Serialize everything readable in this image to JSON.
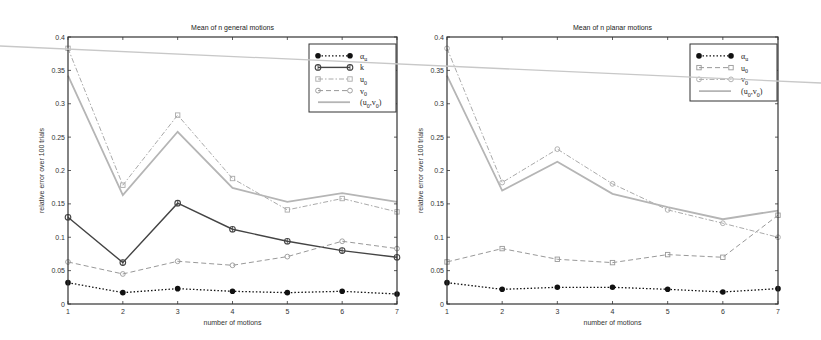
{
  "chart_data": [
    {
      "type": "line",
      "title": "Mean of n general motions",
      "xlabel": "number of motions",
      "ylabel": "relative error  over 100 trials",
      "x": [
        1,
        2,
        3,
        4,
        5,
        6,
        7
      ],
      "xlim": [
        1,
        7
      ],
      "ylim": [
        0,
        0.4
      ],
      "yticks": [
        0,
        0.05,
        0.1,
        0.15,
        0.2,
        0.25,
        0.3,
        0.35,
        0.4
      ],
      "ytick_labels": [
        "0",
        "0.05",
        "0.1",
        "0.15",
        "0.2",
        "0.25",
        "0.3",
        "0.35",
        "0.4"
      ],
      "xtick_labels": [
        "1",
        "2",
        "3",
        "4",
        "5",
        "6",
        "7"
      ],
      "grid": false,
      "legend_position": "upper right",
      "series": [
        {
          "name": "α_u",
          "label_main": "α",
          "label_sub": "u",
          "color": "#111111",
          "dash": "1.5,2",
          "width": 1.3,
          "marker": "filled-circle",
          "values": [
            0.032,
            0.017,
            0.023,
            0.019,
            0.017,
            0.019,
            0.015
          ]
        },
        {
          "name": "k",
          "label_main": "k",
          "label_sub": "",
          "color": "#444444",
          "dash": "",
          "width": 1.4,
          "marker": "diamond",
          "values": [
            0.13,
            0.062,
            0.151,
            0.112,
            0.094,
            0.08,
            0.07
          ]
        },
        {
          "name": "u_0",
          "label_main": "u",
          "label_sub": "0",
          "color": "#aaaaaa",
          "dash": "5,2,1.5,2",
          "width": 1.0,
          "marker": "open-square",
          "values": [
            0.383,
            0.178,
            0.283,
            0.188,
            0.141,
            0.158,
            0.138
          ]
        },
        {
          "name": "v_0",
          "label_main": "v",
          "label_sub": "0",
          "color": "#999999",
          "dash": "5,3",
          "width": 1.0,
          "marker": "open-circle",
          "values": [
            0.063,
            0.045,
            0.064,
            0.058,
            0.071,
            0.094,
            0.083
          ]
        },
        {
          "name": "(u_0,v_0)",
          "label_main": "(u",
          "label_sub": "0",
          "label_rest": ",v",
          "label_sub2": "0",
          "label_close": ")",
          "color": "#b5b5b5",
          "dash": "",
          "width": 1.8,
          "marker": "none",
          "values": [
            0.342,
            0.163,
            0.258,
            0.174,
            0.153,
            0.166,
            0.153
          ]
        }
      ]
    },
    {
      "type": "line",
      "title": "Mean of n planar motions",
      "xlabel": "number of motions",
      "ylabel": "relative error  over 100 trials",
      "x": [
        1,
        2,
        3,
        4,
        5,
        6,
        7
      ],
      "xlim": [
        1,
        7
      ],
      "ylim": [
        0,
        0.4
      ],
      "yticks": [
        0,
        0.05,
        0.1,
        0.15,
        0.2,
        0.25,
        0.3,
        0.35,
        0.4
      ],
      "ytick_labels": [
        "0",
        "0.05",
        "0.1",
        "0.15",
        "0.2",
        "0.25",
        "0.3",
        "0.35",
        "0.4"
      ],
      "xtick_labels": [
        "1",
        "2",
        "3",
        "4",
        "5",
        "6",
        "7"
      ],
      "grid": false,
      "legend_position": "upper right",
      "series": [
        {
          "name": "α_u",
          "label_main": "α",
          "label_sub": "u",
          "color": "#111111",
          "dash": "1.5,2",
          "width": 1.3,
          "marker": "filled-circle",
          "values": [
            0.032,
            0.022,
            0.025,
            0.025,
            0.022,
            0.018,
            0.023
          ]
        },
        {
          "name": "u_0",
          "label_main": "u",
          "label_sub": "0",
          "color": "#999999",
          "dash": "5,3",
          "width": 1.0,
          "marker": "open-square",
          "values": [
            0.063,
            0.083,
            0.067,
            0.062,
            0.074,
            0.07,
            0.133
          ]
        },
        {
          "name": "v_0",
          "label_main": "v",
          "label_sub": "0",
          "color": "#aaaaaa",
          "dash": "5,2,1.5,2",
          "width": 1.0,
          "marker": "open-circle",
          "values": [
            0.383,
            0.182,
            0.232,
            0.18,
            0.141,
            0.121,
            0.1
          ]
        },
        {
          "name": "(u_0,v_0)",
          "label_main": "(u",
          "label_sub": "0",
          "label_rest": ",v",
          "label_sub2": "0",
          "label_close": ")",
          "color": "#b5b5b5",
          "dash": "",
          "width": 1.8,
          "marker": "none",
          "values": [
            0.342,
            0.17,
            0.213,
            0.165,
            0.145,
            0.127,
            0.14
          ]
        }
      ]
    }
  ],
  "layout": {
    "plots": [
      {
        "left": 68,
        "right": 397,
        "top": 37,
        "bottom": 304,
        "legend": {
          "x": 309,
          "y": 44,
          "w": 87,
          "h": 68
        }
      },
      {
        "left": 447,
        "right": 778,
        "top": 37,
        "bottom": 304,
        "legend": {
          "x": 690,
          "y": 44,
          "w": 87,
          "h": 57
        }
      }
    ],
    "scan_line": {
      "x1": 0,
      "y1": 46,
      "x2": 821,
      "y2": 83,
      "color": "#c8c8c8"
    }
  }
}
